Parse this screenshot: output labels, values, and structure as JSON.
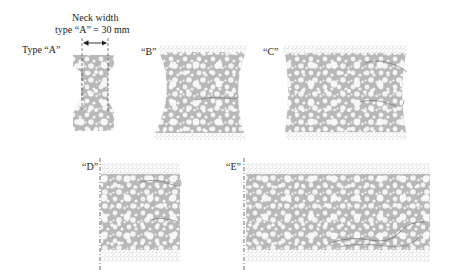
{
  "annotation": {
    "line1": "Neck width",
    "line2": "type “A” = 30 mm"
  },
  "specimens": [
    {
      "id": "A",
      "label": "Type “A”"
    },
    {
      "id": "B",
      "label": "“B”"
    },
    {
      "id": "C",
      "label": "“C”"
    },
    {
      "id": "D",
      "label": "“D”"
    },
    {
      "id": "E",
      "label": "“E”"
    }
  ],
  "colors": {
    "matrix": "#b8b8b8",
    "aggregate": "#f4f4f4",
    "mesh": "#d6d6d6",
    "crack": "#6a6a6a",
    "text": "#222222"
  }
}
